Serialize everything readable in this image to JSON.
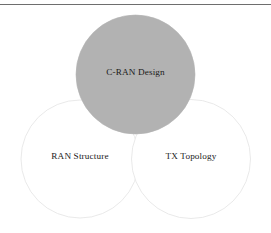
{
  "figure": {
    "type": "venn-diagram",
    "background_color": "#ffffff",
    "top_rule": {
      "color": "#6e6e6e",
      "thickness_px": 1
    },
    "circles": [
      {
        "id": "c-ran-design",
        "label": "C-RAN Design",
        "fill": "#b2b2b2",
        "stroke": "#b2b2b2",
        "cx": 135.5,
        "cy": 74.5,
        "r": 59.5,
        "label_x": 135.5,
        "label_y": 72.5
      },
      {
        "id": "ran-structure",
        "label": "RAN Structure",
        "fill": "#ffffff",
        "stroke": "#e6e6e6",
        "cx": 80,
        "cy": 159,
        "r": 59,
        "label_x": 80,
        "label_y": 157
      },
      {
        "id": "tx-topology",
        "label": "TX Topology",
        "fill": "#ffffff",
        "stroke": "#e6e6e6",
        "cx": 191,
        "cy": 159,
        "r": 59.5,
        "label_x": 191,
        "label_y": 157
      }
    ]
  }
}
